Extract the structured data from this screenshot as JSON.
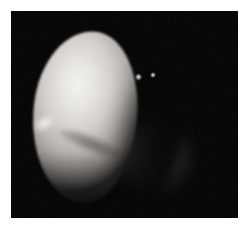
{
  "image": {
    "subject": "planetary-disk-telescope-image",
    "description": "Monochrome astronomical image of a gibbous planetary disk",
    "frame": {
      "background_color": "#000000",
      "page_background_color": "#ffffff",
      "left": 11,
      "top": 11,
      "width": 227,
      "height": 207
    },
    "features": {
      "illuminated_disk": {
        "name": "illuminated-gibbous-limb",
        "highlight_color": "#f2f1ee",
        "midtone_color": "#b4b0ab",
        "shadow_color": "#2a2926",
        "center_x": 74,
        "center_y": 110,
        "width": 104,
        "height": 172
      },
      "terminator": {
        "name": "terminator-shadow-boundary",
        "color": "#000000"
      },
      "nightside_glow": {
        "name": "faint-nightside-limb-glow",
        "color": "#484644",
        "center_x": 144,
        "center_y": 145,
        "width": 92,
        "height": 78
      },
      "surface_band": {
        "name": "dark-surface-band",
        "color": "#282624"
      },
      "limb_bright_spot": {
        "name": "bright-limb-spot",
        "color": "#ffffff"
      },
      "point_lights": [
        {
          "name": "point-light-1",
          "x": 138,
          "y": 77,
          "color": "#ffffff"
        },
        {
          "name": "point-light-2",
          "x": 152,
          "y": 75,
          "color": "#ffffff"
        }
      ]
    }
  }
}
